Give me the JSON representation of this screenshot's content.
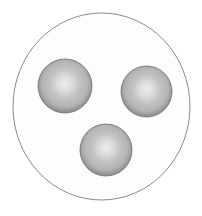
{
  "figure": {
    "canvas": {
      "width": 202,
      "height": 216
    },
    "background_color": "#ffffff",
    "outer_circle": {
      "name": "outer boundary circle",
      "center_x": 101.5,
      "center_y": 106.5,
      "radius_x": 88.5,
      "radius_y": 93.5,
      "fill_color": "#fdfdfd",
      "stroke_color": "#8a8a8a",
      "stroke_width": 1
    },
    "spheres": [
      {
        "id": "sphere-top-left",
        "label": "top-left sphere",
        "center_x": 65,
        "center_y": 86,
        "radius": 27,
        "highlight_color": "#ededed",
        "mid_color": "#b4b4b4",
        "rim_color": "#7d7d7d",
        "edge_color": "#6f6f6f"
      },
      {
        "id": "sphere-right",
        "label": "right sphere",
        "center_x": 146.5,
        "center_y": 91.5,
        "radius": 25.5,
        "highlight_color": "#ededed",
        "mid_color": "#b4b4b4",
        "rim_color": "#7d7d7d",
        "edge_color": "#6f6f6f"
      },
      {
        "id": "sphere-bottom",
        "label": "bottom sphere",
        "center_x": 106,
        "center_y": 150,
        "radius": 26,
        "highlight_color": "#ededed",
        "mid_color": "#b4b4b4",
        "rim_color": "#7d7d7d",
        "edge_color": "#6f6f6f"
      }
    ],
    "highlight_offset": {
      "fx": 0.5,
      "fy": 0.46
    }
  }
}
